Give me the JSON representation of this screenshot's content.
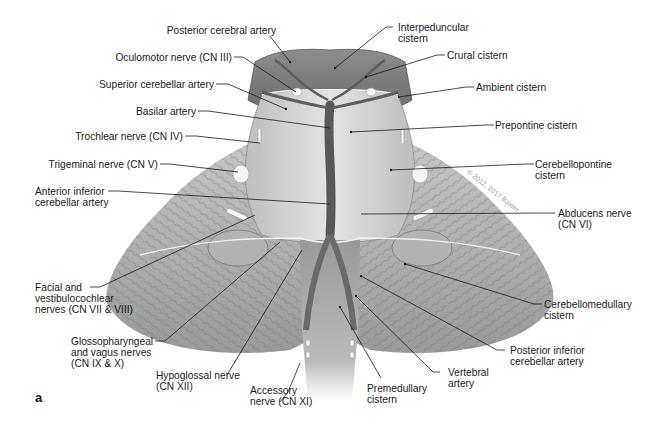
{
  "figure": {
    "panel_letter": "a",
    "watermark": "© 2012, 2017 Baxter",
    "colors": {
      "background": "#ffffff",
      "tissue_light": "#d9d9d9",
      "tissue_mid": "#a8a8a8",
      "tissue_dark": "#6e6e6e",
      "vessel": "#5c5c5c",
      "nerve": "#f2f2f2",
      "leader_line": "#1a1a1a",
      "label_text": "#1a1a1a"
    }
  },
  "labels": {
    "left": [
      {
        "id": "posterior-cerebral-artery",
        "text": "Posterior cerebral artery"
      },
      {
        "id": "oculomotor-nerve",
        "text": "Oculomotor nerve (CN III)"
      },
      {
        "id": "superior-cerebellar-artery",
        "text": "Superior cerebellar artery"
      },
      {
        "id": "basilar-artery",
        "text": "Basilar artery"
      },
      {
        "id": "trochlear-nerve",
        "text": "Trochlear nerve (CN IV)"
      },
      {
        "id": "trigeminal-nerve",
        "text": "Trigeminal nerve (CN V)"
      },
      {
        "id": "anterior-inferior-cerebellar-artery",
        "text": "Anterior inferior\ncerebellar artery"
      },
      {
        "id": "facial-vestibulocochlear-nerves",
        "text": "Facial and\nvestibulocochlear\nnerves (CN VII & VIII)"
      },
      {
        "id": "glossopharyngeal-vagus-nerves",
        "text": "Glossopharyngeal\nand vagus nerves\n(CN IX & X)"
      },
      {
        "id": "hypoglossal-nerve",
        "text": "Hypoglossal nerve\n(CN XII)"
      },
      {
        "id": "accessory-nerve",
        "text": "Accessory\nnerve (CN XI)"
      }
    ],
    "right": [
      {
        "id": "interpeduncular-cistern",
        "text": "Interpeduncular\ncistern"
      },
      {
        "id": "crural-cistern",
        "text": "Crural cistern"
      },
      {
        "id": "ambient-cistern",
        "text": "Ambient cistern"
      },
      {
        "id": "prepontine-cistern",
        "text": "Prepontine cistern"
      },
      {
        "id": "cerebellopontine-cistern",
        "text": "Cerebellopontine\ncistern"
      },
      {
        "id": "abducens-nerve",
        "text": "Abducens nerve\n(CN VI)"
      },
      {
        "id": "cerebellomedullary-cistern",
        "text": "Cerebellomedullary\ncistern"
      },
      {
        "id": "posterior-inferior-cerebellar-artery",
        "text": "Posterior inferior\ncerebellar artery"
      },
      {
        "id": "vertebral-artery",
        "text": "Vertebral\nartery"
      },
      {
        "id": "premedullary-cistern",
        "text": "Premedullary\ncistern"
      }
    ]
  }
}
